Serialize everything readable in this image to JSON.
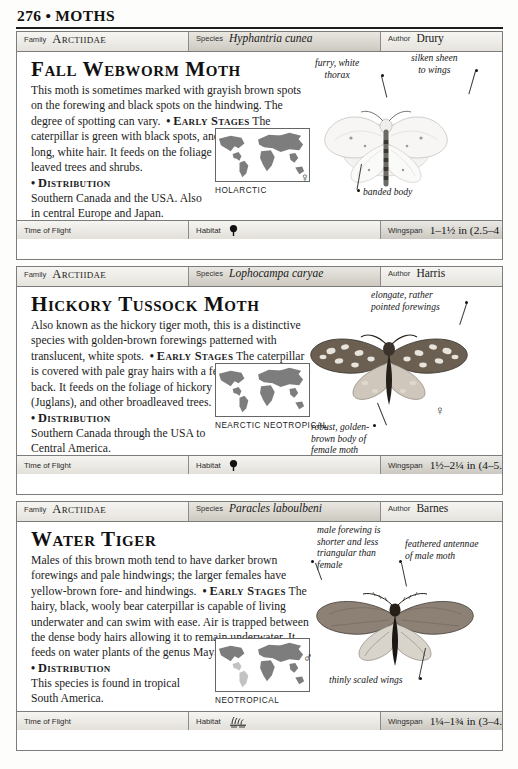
{
  "page": {
    "folio": "276",
    "bullet": "•",
    "section": "MOTHS"
  },
  "labels": {
    "family": "Family",
    "species": "Species",
    "author": "Author",
    "time_of_flight": "Time of Flight",
    "habitat": "Habitat",
    "wingspan": "Wingspan"
  },
  "entries": [
    {
      "family": "Arctiidae",
      "species": "Hyphantria cunea",
      "author": "Drury",
      "common_name": "Fall Webworm Moth",
      "description_1": "This moth is sometimes marked with grayish brown spots on the forewing and black spots on the hindwing. The degree of spotting can vary.",
      "early_stages_heading": "Early Stages",
      "description_2": "The caterpillar is green with black spots, and is covered with long, white hair. It feeds on the foliage of various broad-leaved trees and shrubs.",
      "distribution_heading": "Distribution",
      "distribution_text": "Southern Canada and the USA. Also  in central Europe and Japan.",
      "map_caption": "HOLARCTIC",
      "time_of_flight_icon": "crescent-moon-icon",
      "habitat_icon": "tree-icon",
      "wingspan": "1–1½ in (2.5–4 cm)",
      "sex_symbol": "♀",
      "callouts": [
        "furry, white\nthorax",
        "silken sheen\nto wings",
        "banded body"
      ]
    },
    {
      "family": "Arctiidae",
      "species": "Lophocampa caryae",
      "author": "Harris",
      "common_name": "Hickory Tussock Moth",
      "description_1": "Also known as the hickory tiger moth, this is a distinctive species with golden-brown forewings patterned with translucent, white spots.",
      "early_stages_heading": "Early Stages",
      "description_2": "The caterpillar is covered with pale gray hairs with a few black tufts on the back. It feeds on the foliage of hickory (Carya), walnut (Juglans), and other broadleaved trees.",
      "distribution_heading": "Distribution",
      "distribution_text": "Southern Canada through the USA to Central America.",
      "map_caption": "NEARCTIC\nNEOTROPICAL",
      "time_of_flight_icon": "crescent-moon-icon",
      "habitat_icon": "tree-icon",
      "wingspan": "1½–2¼ in (4–5.5 cm)",
      "sex_symbol": "♀",
      "callouts": [
        "elongate, rather\npointed forewings",
        "robust, golden-\nbrown body of\nfemale moth"
      ]
    },
    {
      "family": "Arctiidae",
      "species": "Paracles laboulbeni",
      "author": "Barnes",
      "common_name": "Water Tiger",
      "description_1": "Males of this brown moth tend to have darker brown forewings and pale hindwings; the larger females have yellow-brown fore- and hindwings.",
      "early_stages_heading": "Early Stages",
      "description_2": "The hairy, black, wooly bear caterpillar is capable of living underwater and can swim with ease. Air is trapped between the dense body hairs allowing it to remain underwater. It feeds on water plants of the genus Mayaca.",
      "distribution_heading": "Distribution",
      "distribution_text": "This species is found in tropical South America.",
      "map_caption": "NEOTROPICAL",
      "time_of_flight_icon": "crescent-moon-icon",
      "habitat_icon": "water-reeds-icon",
      "wingspan": "1¼–1¾ in (3–4.5 cm)",
      "sex_symbol": "♂",
      "callouts": [
        "male forewing is\nshorter and less\ntriangular than\nfemale",
        "feathered antennae\nof male moth",
        "thinly scaled wings"
      ]
    }
  ],
  "colors": {
    "rule": "#1d1d1d",
    "card_border": "#7c7c7c",
    "bar_fill": "#dedbd5",
    "map_land": "#7d7d7d",
    "text": "#1a1a1a"
  }
}
